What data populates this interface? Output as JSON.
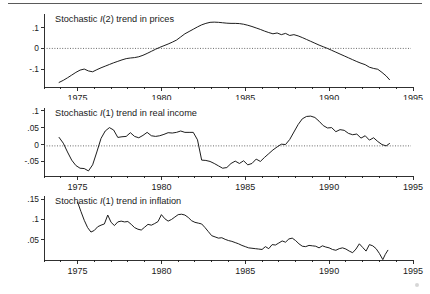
{
  "figure": {
    "background": "#ffffff",
    "line_color": "#111111",
    "zeroline_color": "#444444",
    "top_rule": true
  },
  "chart_data": [
    {
      "type": "line",
      "panel": 1,
      "title": "Stochastic I(2) trend in prices",
      "title_prefix": "Stochastic ",
      "title_em": "I",
      "title_suffix": "(2) trend in prices",
      "xlabel": "",
      "ylabel": "",
      "grid": false,
      "legend": "none",
      "zero_reference_line": 0,
      "xlim": [
        1973.0,
        1995.0
      ],
      "ylim": [
        -0.185,
        0.165
      ],
      "xticks": [
        1975,
        1980,
        1985,
        1990,
        1995
      ],
      "xticklabels": [
        "1975",
        "1980",
        "1985",
        "1990",
        "1995"
      ],
      "xminortick_interval": 1,
      "yticks": [
        -0.1,
        0,
        0.1
      ],
      "yticklabels": [
        "-.1",
        "0",
        ".1"
      ],
      "x": [
        1973.9,
        1974.15,
        1974.4,
        1974.65,
        1974.9,
        1975.15,
        1975.4,
        1975.65,
        1975.9,
        1976.15,
        1976.4,
        1976.65,
        1976.9,
        1977.15,
        1977.4,
        1977.65,
        1977.9,
        1978.15,
        1978.4,
        1978.65,
        1978.9,
        1979.15,
        1979.4,
        1979.65,
        1979.9,
        1980.15,
        1980.4,
        1980.65,
        1980.9,
        1981.15,
        1981.4,
        1981.65,
        1981.9,
        1982.15,
        1982.4,
        1982.65,
        1982.9,
        1983.15,
        1983.4,
        1983.65,
        1983.9,
        1984.15,
        1984.4,
        1984.65,
        1984.9,
        1985.15,
        1985.4,
        1985.65,
        1985.9,
        1986.15,
        1986.4,
        1986.65,
        1986.9,
        1987.15,
        1987.4,
        1987.65,
        1987.9,
        1988.15,
        1988.4,
        1988.65,
        1988.9,
        1989.15,
        1989.4,
        1989.65,
        1989.9,
        1990.15,
        1990.4,
        1990.65,
        1990.9,
        1991.15,
        1991.4,
        1991.65,
        1991.9,
        1992.15,
        1992.4,
        1992.65,
        1992.9,
        1993.15,
        1993.4,
        1993.6
      ],
      "values": [
        -0.163,
        -0.153,
        -0.141,
        -0.128,
        -0.115,
        -0.104,
        -0.099,
        -0.108,
        -0.112,
        -0.102,
        -0.093,
        -0.085,
        -0.077,
        -0.069,
        -0.062,
        -0.055,
        -0.049,
        -0.046,
        -0.044,
        -0.04,
        -0.033,
        -0.024,
        -0.014,
        -0.004,
        0.005,
        0.013,
        0.021,
        0.03,
        0.04,
        0.055,
        0.07,
        0.081,
        0.092,
        0.103,
        0.113,
        0.12,
        0.125,
        0.126,
        0.125,
        0.123,
        0.121,
        0.12,
        0.12,
        0.119,
        0.116,
        0.111,
        0.105,
        0.098,
        0.091,
        0.083,
        0.076,
        0.07,
        0.074,
        0.066,
        0.072,
        0.062,
        0.066,
        0.06,
        0.052,
        0.043,
        0.034,
        0.025,
        0.016,
        0.008,
        0.0,
        -0.009,
        -0.018,
        -0.027,
        -0.036,
        -0.045,
        -0.054,
        -0.063,
        -0.071,
        -0.078,
        -0.09,
        -0.096,
        -0.1,
        -0.115,
        -0.132,
        -0.15
      ]
    },
    {
      "type": "line",
      "panel": 2,
      "title": "Stochastic I(1) trend in real income",
      "title_prefix": "Stochastic ",
      "title_em": "I",
      "title_suffix": "(1) trend in real income",
      "xlabel": "",
      "ylabel": "",
      "grid": false,
      "legend": "none",
      "zero_reference_line": -0.004,
      "xlim": [
        1973.0,
        1995.0
      ],
      "ylim": [
        -0.093,
        0.108
      ],
      "xticks": [
        1975,
        1980,
        1985,
        1990,
        1995
      ],
      "xticklabels": [
        "1975",
        "1980",
        "1985",
        "1990",
        "1995"
      ],
      "xminortick_interval": 1,
      "yticks": [
        -0.05,
        0,
        0.05,
        0.1
      ],
      "yticklabels": [
        "-.05",
        "0",
        ".05",
        ".1"
      ],
      "x": [
        1973.9,
        1974.15,
        1974.4,
        1974.65,
        1974.9,
        1975.15,
        1975.4,
        1975.65,
        1975.9,
        1976.15,
        1976.4,
        1976.65,
        1976.9,
        1977.15,
        1977.4,
        1977.65,
        1977.9,
        1978.15,
        1978.4,
        1978.65,
        1978.9,
        1979.15,
        1979.4,
        1979.65,
        1979.9,
        1980.15,
        1980.4,
        1980.65,
        1980.9,
        1981.15,
        1981.4,
        1981.65,
        1981.9,
        1982.15,
        1982.4,
        1982.65,
        1982.9,
        1983.15,
        1983.4,
        1983.65,
        1983.9,
        1984.15,
        1984.4,
        1984.65,
        1984.9,
        1985.15,
        1985.4,
        1985.65,
        1985.9,
        1986.15,
        1986.4,
        1986.65,
        1986.9,
        1987.15,
        1987.4,
        1987.65,
        1987.9,
        1988.15,
        1988.4,
        1988.65,
        1988.9,
        1989.15,
        1989.4,
        1989.65,
        1989.9,
        1990.15,
        1990.4,
        1990.65,
        1990.9,
        1991.15,
        1991.4,
        1991.65,
        1991.9,
        1992.15,
        1992.4,
        1992.65,
        1992.9,
        1993.15,
        1993.4,
        1993.6
      ],
      "values": [
        0.021,
        0.004,
        -0.022,
        -0.046,
        -0.062,
        -0.07,
        -0.071,
        -0.078,
        -0.06,
        -0.022,
        0.018,
        0.04,
        0.05,
        0.043,
        0.021,
        0.023,
        0.024,
        0.035,
        0.024,
        0.02,
        0.027,
        0.036,
        0.026,
        0.024,
        0.026,
        0.03,
        0.035,
        0.034,
        0.036,
        0.04,
        0.036,
        0.036,
        0.036,
        0.014,
        -0.046,
        -0.047,
        -0.05,
        -0.056,
        -0.063,
        -0.07,
        -0.068,
        -0.056,
        -0.049,
        -0.056,
        -0.048,
        -0.06,
        -0.056,
        -0.043,
        -0.05,
        -0.038,
        -0.027,
        -0.016,
        -0.007,
        0.001,
        0.0,
        0.015,
        0.037,
        0.059,
        0.076,
        0.083,
        0.084,
        0.08,
        0.069,
        0.056,
        0.049,
        0.05,
        0.038,
        0.044,
        0.042,
        0.033,
        0.029,
        0.031,
        0.019,
        0.026,
        0.013,
        0.02,
        0.009,
        0.0,
        -0.004,
        0.003
      ]
    },
    {
      "type": "line",
      "panel": 3,
      "title": "Stochastic I(1) trend in inflation",
      "title_prefix": "Stochastic ",
      "title_em": "I",
      "title_suffix": "(1) trend in inflation",
      "xlabel": "",
      "ylabel": "",
      "grid": false,
      "legend": "none",
      "zero_reference_line": null,
      "xlim": [
        1973.0,
        1995.0
      ],
      "ylim": [
        0.0,
        0.158
      ],
      "xticks": [
        1975,
        1980,
        1985,
        1990,
        1995
      ],
      "xticklabels": [
        "1975",
        "1980",
        "1985",
        "1990",
        "1995"
      ],
      "xminortick_interval": 1,
      "yticks": [
        0.05,
        0.1,
        0.15
      ],
      "yticklabels": [
        ".05",
        ".1",
        ".15"
      ],
      "x": [
        1975.0,
        1975.2,
        1975.4,
        1975.6,
        1975.8,
        1976.0,
        1976.2,
        1976.4,
        1976.6,
        1976.8,
        1977.0,
        1977.2,
        1977.4,
        1977.6,
        1977.8,
        1978.0,
        1978.2,
        1978.4,
        1978.6,
        1978.8,
        1979.0,
        1979.2,
        1979.4,
        1979.6,
        1979.8,
        1980.0,
        1980.2,
        1980.4,
        1980.6,
        1980.8,
        1981.0,
        1981.2,
        1981.4,
        1981.6,
        1981.8,
        1982.0,
        1982.2,
        1982.4,
        1982.6,
        1982.8,
        1983.0,
        1983.2,
        1983.4,
        1983.6,
        1983.8,
        1984.0,
        1984.2,
        1984.4,
        1984.6,
        1984.8,
        1985.0,
        1985.2,
        1985.4,
        1985.6,
        1985.8,
        1986.0,
        1986.2,
        1986.4,
        1986.6,
        1986.8,
        1987.0,
        1987.2,
        1987.4,
        1987.6,
        1987.8,
        1988.0,
        1988.2,
        1988.4,
        1988.6,
        1988.8,
        1989.0,
        1989.2,
        1989.4,
        1989.6,
        1989.8,
        1990.0,
        1990.2,
        1990.4,
        1990.6,
        1990.8,
        1991.0,
        1991.2,
        1991.4,
        1991.6,
        1991.8,
        1992.0,
        1992.2,
        1992.4,
        1992.6,
        1992.8,
        1993.0,
        1993.2,
        1993.35,
        1993.5
      ],
      "values": [
        0.143,
        0.12,
        0.098,
        0.08,
        0.069,
        0.073,
        0.082,
        0.086,
        0.089,
        0.111,
        0.093,
        0.085,
        0.094,
        0.096,
        0.094,
        0.095,
        0.088,
        0.08,
        0.076,
        0.074,
        0.081,
        0.088,
        0.086,
        0.09,
        0.095,
        0.112,
        0.102,
        0.096,
        0.1,
        0.106,
        0.112,
        0.113,
        0.111,
        0.105,
        0.097,
        0.093,
        0.091,
        0.089,
        0.08,
        0.07,
        0.06,
        0.057,
        0.054,
        0.055,
        0.051,
        0.048,
        0.046,
        0.043,
        0.04,
        0.036,
        0.033,
        0.03,
        0.029,
        0.028,
        0.027,
        0.026,
        0.033,
        0.028,
        0.038,
        0.037,
        0.042,
        0.047,
        0.044,
        0.052,
        0.054,
        0.048,
        0.04,
        0.034,
        0.033,
        0.036,
        0.035,
        0.034,
        0.03,
        0.035,
        0.032,
        0.03,
        0.026,
        0.024,
        0.028,
        0.03,
        0.027,
        0.022,
        0.018,
        0.027,
        0.04,
        0.031,
        0.022,
        0.038,
        0.035,
        0.028,
        0.016,
        0.001,
        0.014,
        0.024
      ]
    }
  ]
}
